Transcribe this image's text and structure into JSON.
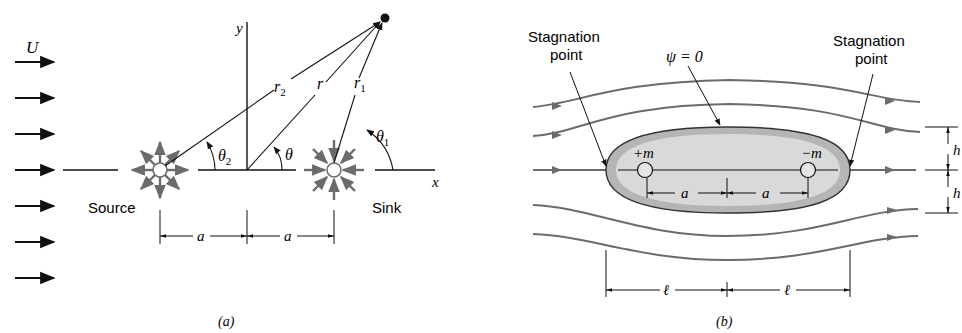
{
  "figure_a": {
    "caption": "(a)",
    "uniform_flow_label": "U",
    "axis_x_label": "x",
    "axis_y_label": "y",
    "source_label": "Source",
    "sink_label": "Sink",
    "r_label": "r",
    "r1_label": "r",
    "r1_sub": "1",
    "r2_label": "r",
    "r2_sub": "2",
    "theta_label": "θ",
    "theta1_label": "θ",
    "theta1_sub": "1",
    "theta2_label": "θ",
    "theta2_sub": "2",
    "dim_left_label": "a",
    "dim_right_label": "a",
    "uniform_arrow_count": 7
  },
  "figure_b": {
    "caption": "(b)",
    "stagnation_left_line1": "Stagnation",
    "stagnation_left_line2": "point",
    "stagnation_right_line1": "Stagnation",
    "stagnation_right_line2": "point",
    "streamline_label": "ψ = 0",
    "source_strength_label": "+m",
    "sink_strength_label": "−m",
    "dim_a_left": "a",
    "dim_a_right": "a",
    "dim_h_top": "h",
    "dim_h_bottom": "h",
    "dim_l_left": "ℓ",
    "dim_l_right": "ℓ"
  },
  "colors": {
    "ink": "#111111",
    "gray_ink": "#6b6b6b",
    "body_fill_outer": "#b8b8b8",
    "body_fill_inner": "#dcdcdc"
  }
}
